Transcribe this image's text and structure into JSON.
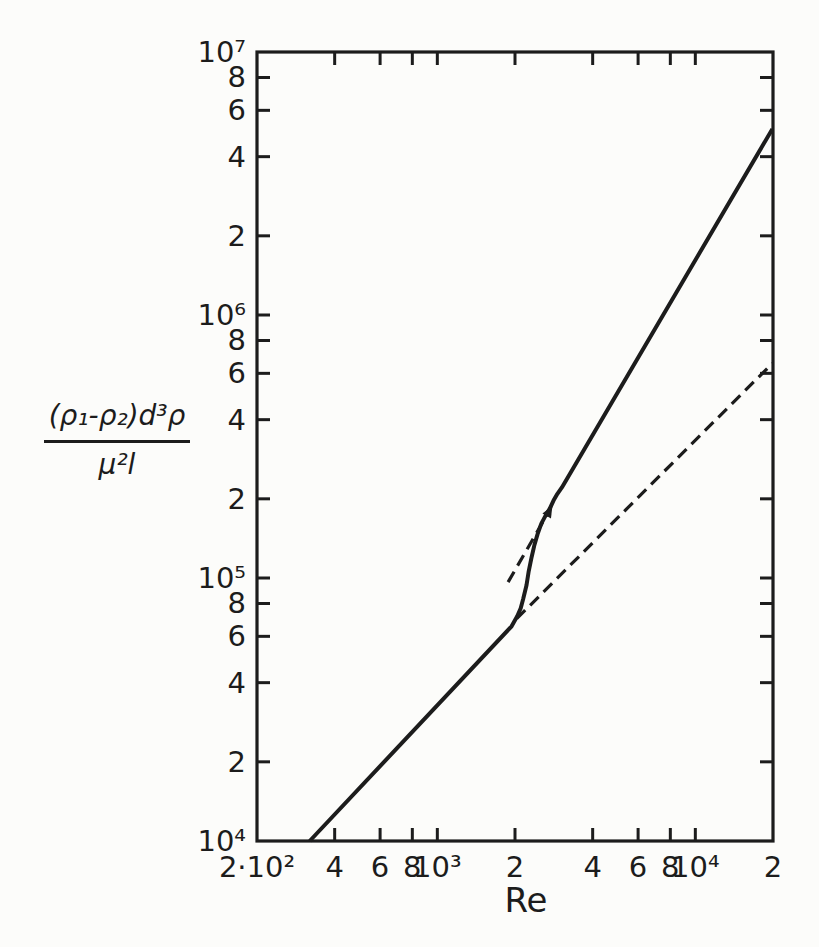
{
  "figure": {
    "background_color": "#fcfcfa",
    "ink_color": "#1c1c1c"
  },
  "formula": {
    "numerator": "(ρ₁-ρ₂)d³ρ",
    "denominator": "μ²l"
  },
  "chart_data": {
    "type": "line",
    "title": "",
    "xlabel": "Re",
    "ylabel": "(ρ₁-ρ₂)d³ρ / μ²l",
    "x_scale": "log",
    "y_scale": "log",
    "xlim": [
      200,
      20000
    ],
    "ylim": [
      10000,
      10000000
    ],
    "grid": false,
    "legend": false,
    "x_ticks": [
      {
        "value": 200,
        "label": "2·10²"
      },
      {
        "value": 400,
        "label": "4"
      },
      {
        "value": 600,
        "label": "6"
      },
      {
        "value": 800,
        "label": "8"
      },
      {
        "value": 1000,
        "label": "10³"
      },
      {
        "value": 2000,
        "label": "2"
      },
      {
        "value": 4000,
        "label": "4"
      },
      {
        "value": 6000,
        "label": "6"
      },
      {
        "value": 8000,
        "label": "8"
      },
      {
        "value": 10000,
        "label": "10⁴"
      },
      {
        "value": 20000,
        "label": "2"
      }
    ],
    "y_ticks": [
      {
        "value": 10000,
        "label": "10⁴"
      },
      {
        "value": 20000,
        "label": "2"
      },
      {
        "value": 40000,
        "label": "4"
      },
      {
        "value": 60000,
        "label": "6"
      },
      {
        "value": 80000,
        "label": "8"
      },
      {
        "value": 100000,
        "label": "10⁵"
      },
      {
        "value": 200000,
        "label": "2"
      },
      {
        "value": 400000,
        "label": "4"
      },
      {
        "value": 600000,
        "label": "6"
      },
      {
        "value": 800000,
        "label": "8"
      },
      {
        "value": 1000000,
        "label": "10⁶"
      },
      {
        "value": 2000000,
        "label": "2"
      },
      {
        "value": 4000000,
        "label": "4"
      },
      {
        "value": 6000000,
        "label": "6"
      },
      {
        "value": 8000000,
        "label": "8"
      },
      {
        "value": 10000000,
        "label": "10⁷"
      }
    ],
    "series": [
      {
        "name": "main-curve",
        "style": "solid",
        "points": [
          [
            320,
            10000
          ],
          [
            1940,
            65500
          ],
          [
            2040,
            71500
          ],
          [
            2105,
            76700
          ],
          [
            2150,
            83000
          ],
          [
            2216,
            93800
          ],
          [
            2260,
            106000
          ],
          [
            2320,
            120000
          ],
          [
            2380,
            134000
          ],
          [
            2445,
            146500
          ],
          [
            2530,
            161000
          ],
          [
            2630,
            173000
          ],
          [
            2730,
            184000
          ],
          [
            2820,
            197000
          ],
          [
            2920,
            209000
          ],
          [
            3040,
            221000
          ],
          [
            19900,
            5100000
          ]
        ]
      },
      {
        "name": "lower-branch-extension",
        "style": "dashed",
        "points": [
          [
            2030,
            70000
          ],
          [
            19900,
            655000
          ]
        ]
      },
      {
        "name": "upper-branch-extension",
        "style": "dashed",
        "points": [
          [
            1880,
            96500
          ],
          [
            2680,
            176000
          ]
        ]
      }
    ],
    "annotations": [
      {
        "type": "arrowhead",
        "x": 2720,
        "y": 182000,
        "direction": "up-right"
      }
    ]
  }
}
